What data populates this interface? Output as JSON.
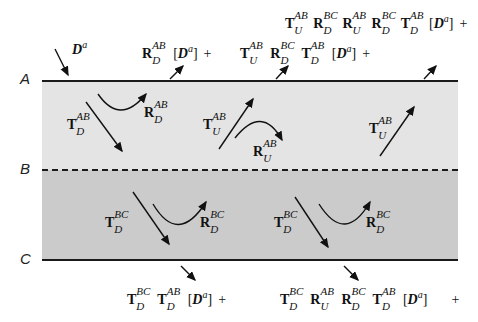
{
  "interfaces": {
    "A": "A",
    "B": "B",
    "C": "C"
  },
  "incident": {
    "symbol": "D",
    "superscript": "a"
  },
  "top_expressions": [
    {
      "terms": [
        {
          "op": "R",
          "sup": "AB",
          "sub": "D"
        }
      ],
      "tail": "[D^a]",
      "plus": "+"
    },
    {
      "terms": [
        {
          "op": "T",
          "sup": "AB",
          "sub": "U"
        },
        {
          "op": "R",
          "sup": "BC",
          "sub": "D"
        },
        {
          "op": "T",
          "sup": "AB",
          "sub": "D"
        }
      ],
      "tail": "[D^a]",
      "plus": "+"
    },
    {
      "terms": [
        {
          "op": "T",
          "sup": "AB",
          "sub": "U"
        },
        {
          "op": "R",
          "sup": "BC",
          "sub": "D"
        },
        {
          "op": "R",
          "sup": "AB",
          "sub": "U"
        },
        {
          "op": "R",
          "sup": "BC",
          "sub": "D"
        },
        {
          "op": "T",
          "sup": "AB",
          "sub": "D"
        }
      ],
      "tail": "[D^a]",
      "plus": "+"
    }
  ],
  "bottom_expressions": [
    {
      "terms": [
        {
          "op": "T",
          "sup": "BC",
          "sub": "D"
        },
        {
          "op": "T",
          "sup": "AB",
          "sub": "D"
        }
      ],
      "tail": "[D^a]",
      "plus": "+"
    },
    {
      "terms": [
        {
          "op": "T",
          "sup": "BC",
          "sub": "D"
        },
        {
          "op": "R",
          "sup": "AB",
          "sub": "U"
        },
        {
          "op": "R",
          "sup": "BC",
          "sub": "D"
        },
        {
          "op": "T",
          "sup": "AB",
          "sub": "D"
        }
      ],
      "tail": "[D^a]",
      "plus": "+"
    }
  ],
  "layer_labels": {
    "t_ab_d": {
      "op": "T",
      "sup": "AB",
      "sub": "D"
    },
    "r_ab_d": {
      "op": "R",
      "sup": "AB",
      "sub": "D"
    },
    "t_ab_u_1": {
      "op": "T",
      "sup": "AB",
      "sub": "U"
    },
    "r_ab_u": {
      "op": "R",
      "sup": "AB",
      "sub": "U"
    },
    "t_ab_u_2": {
      "op": "T",
      "sup": "AB",
      "sub": "U"
    },
    "t_bc_d_1": {
      "op": "T",
      "sup": "BC",
      "sub": "D"
    },
    "r_bc_d_1": {
      "op": "R",
      "sup": "BC",
      "sub": "D"
    },
    "t_bc_d_2": {
      "op": "T",
      "sup": "BC",
      "sub": "D"
    },
    "r_bc_d_2": {
      "op": "R",
      "sup": "BC",
      "sub": "D"
    }
  },
  "colors": {
    "upper_layer": "#e4e4e4",
    "lower_layer": "#cbcbcb",
    "lines": "#1a1a1a"
  }
}
